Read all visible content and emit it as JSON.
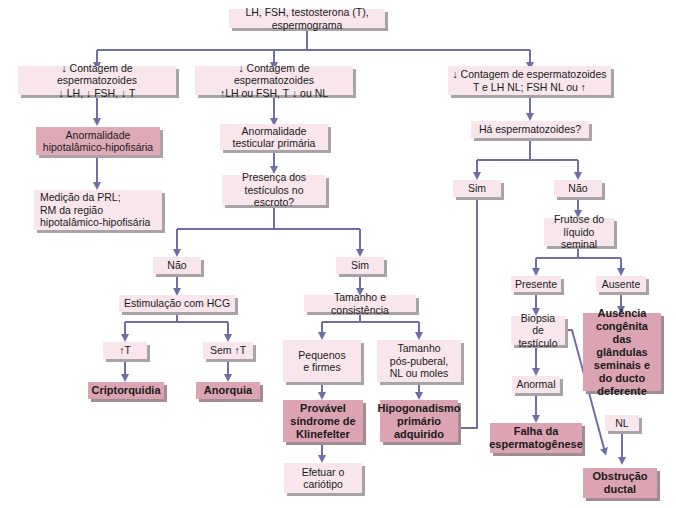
{
  "diagram": {
    "colors": {
      "connector": "#6e6ea8",
      "box_light": "#f6e3ea",
      "box_highlight": "#dfaab7",
      "box_result": "#dca3b2",
      "shadow": "#a9a3a7"
    },
    "nodes": {
      "root": "LH, FSH, testosterona (T), espermograma",
      "branch_left": "↓ Contagem de espermatozoides\n↓ LH, ↓ FSH, ↓ T",
      "branch_middle": "↓ Contagem de espermatozoides\n↑LH ou FSH, T ↓ ou NL",
      "branch_right": "↓ Contagem de espermatozoides\nT e LH NL; FSH NL ou ↑",
      "hypothalamic_abnormality": "Anormalidade\nhipotalâmico-hipofisária",
      "prl_measurement": "Medição da PRL;\n  RM da região\n  hipotalâmico-hipofisária",
      "primary_testicular": "Anormalidade\ntesticular primária",
      "testes_in_scrotum": "Presença dos\ntestículos no escroto?",
      "scrotum_no": "Não",
      "scrotum_yes": "Sim",
      "hcg_stimulation": "Estimulação com HCG",
      "t_increase": "↑T",
      "no_t_increase": "Sem ↑T",
      "cryptorchidism": "Criptorquidia",
      "anorchia": "Anorquia",
      "size_consistency": "Tamanho e consistência",
      "small_firm": "Pequenos\ne firmes",
      "postpubertal_size": "Tamanho\npós-puberal,\nNL ou moles",
      "klinefelter": "Provável\nsíndrome de\nKlinefelter",
      "karyotype": "Efetuar o\ncariótipo",
      "acquired_hypogonadism": "Hipogonadismo\nprimário\nadquirido",
      "sperm_present": "Há espermatozoides?",
      "sperm_yes": "Sim",
      "sperm_no": "Não",
      "fructose": "Frutose do\nlíquido seminal",
      "fructose_present": "Presente",
      "fructose_absent": "Ausente",
      "congenital_absence": "Ausência\ncongênita\ndas glândulas\nseminais e\ndo ducto\ndeferente",
      "testicular_biopsy": "Biopsia de\ntestículo",
      "biopsy_abnormal": "Anormal",
      "spermatogenesis_failure": "Falha da\nespermatogênese",
      "biopsy_normal": "NL",
      "ductal_obstruction": "Obstrução\nductal"
    }
  }
}
